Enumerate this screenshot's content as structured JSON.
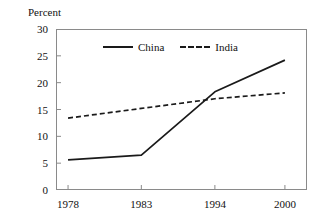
{
  "chart_data": {
    "type": "line",
    "title": "",
    "subtitle": "",
    "xlabel": "",
    "ylabel": "Percent",
    "categories": [
      "1978",
      "1983",
      "1994",
      "2000"
    ],
    "series": [
      {
        "name": "China",
        "style": "solid",
        "color": "#1a1a1a",
        "values": [
          5.6,
          6.5,
          18.3,
          24.2
        ]
      },
      {
        "name": "India",
        "style": "dashed",
        "color": "#1a1a1a",
        "values": [
          13.4,
          15.2,
          17.0,
          18.1
        ]
      }
    ],
    "ylim": [
      0,
      30
    ],
    "yticks": [
      0,
      5,
      10,
      15,
      20,
      25,
      30
    ],
    "ytick_labels": [
      "0",
      "5",
      "10",
      "15",
      "20",
      "25",
      "30"
    ],
    "xtick_labels": [
      "1978",
      "1983",
      "1994",
      "2000"
    ],
    "grid": false,
    "legend_position": "top-center",
    "frame": "box"
  },
  "axis": {
    "y_title": "Percent"
  },
  "legend": {
    "items": [
      {
        "label": "China",
        "style": "solid"
      },
      {
        "label": "India",
        "style": "dashed"
      }
    ]
  },
  "colors": {
    "line": "#1a1a1a",
    "frame": "#8a8a8a",
    "text": "#111111",
    "background": "#ffffff"
  }
}
